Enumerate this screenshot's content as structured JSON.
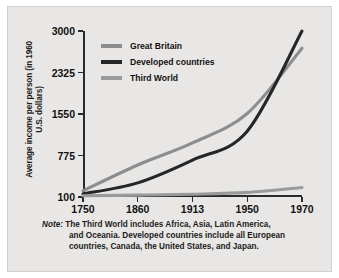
{
  "chart_data": {
    "type": "line",
    "title": "",
    "xlabel": "",
    "ylabel": "Average income per person (in 1960 U.S. dollars)",
    "categories": [
      "1750",
      "1860",
      "1913",
      "1950",
      "1970"
    ],
    "x_tick_labels": [
      "1750",
      "1860",
      "1913",
      "1950",
      "1970"
    ],
    "y_tick_labels": [
      "100",
      "775",
      "1550",
      "2325",
      "3000"
    ],
    "y_tick_values": [
      100,
      775,
      1550,
      2325,
      3000
    ],
    "ylim": [
      100,
      3000
    ],
    "grid": false,
    "legend_position": "top-left",
    "series": [
      {
        "name": "Great Britain",
        "color": "#8d8d8d",
        "values": [
          200,
          620,
          1010,
          1560,
          2720
        ]
      },
      {
        "name": "Developed countries",
        "color": "#262626",
        "values": [
          150,
          330,
          700,
          1230,
          3000
        ]
      },
      {
        "name": "Third World",
        "color": "#9a9a9a",
        "values": [
          120,
          130,
          145,
          175,
          255
        ]
      }
    ],
    "annotations": {
      "note_label": "Note:",
      "note_lines": [
        "The Third World includes Africa, Asia, Latin America,",
        "and Oceania. Developed countries include all European",
        "countries, Canada, the United States, and Japan."
      ]
    }
  },
  "colors": {
    "panel_background": "#e9e7e5",
    "page_background": "#ffffff",
    "axis": "#2a2a2a",
    "text": "#111111"
  }
}
